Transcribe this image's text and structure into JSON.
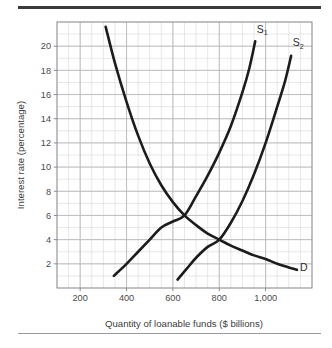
{
  "figure": {
    "background_color": "#ffffff",
    "top_rule_color": "#3a3a3a",
    "bottom_rule_color": "#9a9a9a"
  },
  "chart_data": {
    "type": "line",
    "title": "",
    "subtitle": "",
    "xlabel": "Quantity of loanable funds ($ billions)",
    "ylabel": "Interest rate (percentage)",
    "xlim": [
      100,
      1200
    ],
    "ylim": [
      0,
      22
    ],
    "xticks": [
      200,
      400,
      600,
      800,
      1000
    ],
    "xtick_labels": [
      "200",
      "400",
      "600",
      "800",
      "1,000"
    ],
    "yticks": [
      2,
      4,
      6,
      8,
      10,
      12,
      14,
      16,
      18,
      20
    ],
    "ytick_labels": [
      "2",
      "4",
      "6",
      "8",
      "10",
      "12",
      "14",
      "16",
      "18",
      "20"
    ],
    "grid": true,
    "grid_minor": true,
    "grid_color": "#b9b9bd",
    "grid_minor_color": "#d8d8dc",
    "grid_x_step": 50,
    "grid_y_step": 1,
    "legend": "none",
    "curve_color": "#1c1c1c",
    "curve_width": 2.6,
    "series": [
      {
        "name": "D",
        "label": "D",
        "label_sub": "",
        "role": "demand",
        "description": "Downward sloping demand curve for loanable funds",
        "points": [
          [
            310,
            21.6
          ],
          [
            350,
            18.6
          ],
          [
            400,
            15.4
          ],
          [
            450,
            12.6
          ],
          [
            500,
            10.3
          ],
          [
            550,
            8.5
          ],
          [
            600,
            7.1
          ],
          [
            650,
            6.0
          ],
          [
            700,
            5.2
          ],
          [
            750,
            4.5
          ],
          [
            800,
            4.0
          ],
          [
            850,
            3.5
          ],
          [
            900,
            3.1
          ],
          [
            950,
            2.7
          ],
          [
            1000,
            2.4
          ],
          [
            1050,
            2.0
          ],
          [
            1100,
            1.7
          ],
          [
            1135,
            1.5
          ]
        ],
        "label_position": [
          1165,
          1.4
        ]
      },
      {
        "name": "S1",
        "label": "S",
        "label_sub": "1",
        "role": "supply-original",
        "description": "Upward sloping original supply curve of loanable funds",
        "points": [
          [
            345,
            1.0
          ],
          [
            400,
            2.0
          ],
          [
            450,
            3.0
          ],
          [
            500,
            4.0
          ],
          [
            550,
            5.0
          ],
          [
            600,
            5.5
          ],
          [
            650,
            6.0
          ],
          [
            700,
            7.6
          ],
          [
            750,
            9.3
          ],
          [
            800,
            11.2
          ],
          [
            850,
            13.4
          ],
          [
            900,
            16.2
          ],
          [
            930,
            18.2
          ],
          [
            955,
            20.4
          ]
        ],
        "label_position": [
          985,
          21.1
        ]
      },
      {
        "name": "S2",
        "label": "S",
        "label_sub": "2",
        "role": "supply-shifted",
        "description": "Upward sloping shifted supply curve of loanable funds",
        "points": [
          [
            620,
            0.7
          ],
          [
            660,
            1.6
          ],
          [
            700,
            2.5
          ],
          [
            750,
            3.4
          ],
          [
            800,
            4.0
          ],
          [
            850,
            5.4
          ],
          [
            900,
            7.2
          ],
          [
            950,
            9.4
          ],
          [
            1000,
            12.0
          ],
          [
            1050,
            15.0
          ],
          [
            1085,
            17.2
          ],
          [
            1110,
            19.2
          ]
        ],
        "label_position": [
          1140,
          20.0
        ]
      }
    ],
    "intersections": [
      {
        "label": "D x S1",
        "x": 650,
        "y": 6.0
      },
      {
        "label": "D x S2",
        "x": 800,
        "y": 4.0
      }
    ]
  }
}
